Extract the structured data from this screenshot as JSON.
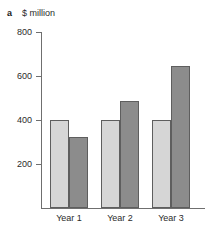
{
  "panel": {
    "label": "a"
  },
  "chart_data": {
    "type": "bar",
    "title": "",
    "subtitle": "",
    "xlabel": "",
    "ylabel": "$ million",
    "ylim": [
      0,
      800
    ],
    "yticks": [
      800,
      600,
      400,
      200
    ],
    "ytick_labels": [
      "800",
      "600",
      "400",
      "200"
    ],
    "grid": false,
    "legend": "none",
    "categories": [
      "Year 1",
      "Year 2",
      "Year 3"
    ],
    "series": [
      {
        "name": "light-series",
        "color": "#d6d6d6",
        "values": [
          400,
          400,
          400
        ]
      },
      {
        "name": "dark-series",
        "color": "#8c8c8c",
        "values": [
          322,
          486,
          645
        ]
      }
    ]
  }
}
